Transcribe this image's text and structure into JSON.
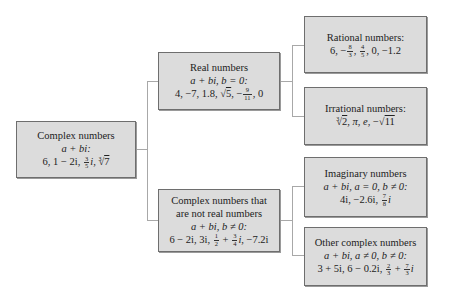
{
  "nodes": {
    "complex": {
      "title": "Complex numbers",
      "condition": "a + bi:",
      "examples": [
        "6",
        "1 − 2i",
        "3/5 i",
        "∛7"
      ]
    },
    "real": {
      "title": "Real numbers",
      "condition": "a + bi, b = 0:",
      "examples": [
        "4",
        "−7",
        "1.8",
        "√5",
        "−9/11",
        "0"
      ]
    },
    "nonreal": {
      "title_line1": "Complex numbers that",
      "title_line2": "are not real numbers",
      "condition": "a + bi, b ≠ 0:",
      "examples": [
        "6 − 2i",
        "3i",
        "1/2 + 3/4 i",
        "−7.2i"
      ]
    },
    "rational": {
      "title": "Rational numbers:",
      "examples": [
        "6",
        "−8/3",
        "4/5",
        "0",
        "−1.2"
      ]
    },
    "irrational": {
      "title": "Irrational numbers:",
      "examples": [
        "∛2",
        "π",
        "e",
        "−√11"
      ]
    },
    "imaginary": {
      "title": "Imaginary numbers",
      "condition": "a + bi, a = 0, b ≠ 0:",
      "examples": [
        "4i",
        "−2.6i",
        "7/8 i"
      ]
    },
    "other": {
      "title": "Other complex numbers",
      "condition": "a + bi, a ≠ 0, b ≠ 0:",
      "examples": [
        "3 + 5i",
        "6 − 0.2i",
        "2/3 + 7/3 i"
      ]
    }
  },
  "edges": [
    [
      "complex",
      "real"
    ],
    [
      "complex",
      "nonreal"
    ],
    [
      "real",
      "rational"
    ],
    [
      "real",
      "irrational"
    ],
    [
      "nonreal",
      "imaginary"
    ],
    [
      "nonreal",
      "other"
    ]
  ],
  "text": {
    "sep": ", ",
    "six": "6",
    "one_minus_2i": "1 − 2i",
    "i": "i",
    "three": "3",
    "five": "5",
    "seven": "7",
    "four": "4",
    "m7": "−7",
    "onept8": "1.8",
    "nine": "9",
    "eleven": "11",
    "zero": "0",
    "minus": "−",
    "eight": "8",
    "m1pt2": "−1.2",
    "two": "2",
    "pi": "π",
    "e": "e",
    "six_m2i": "6 − 2i",
    "three_i": "3i",
    "one": "1",
    "plus": " + ",
    "m7pt2i": "−7.2i",
    "four_i": "4i",
    "m2pt6i": "−2.6i",
    "three_p5i": "3 + 5i",
    "six_m0pt2i": "6 − 0.2i",
    "sqrt": "√"
  }
}
